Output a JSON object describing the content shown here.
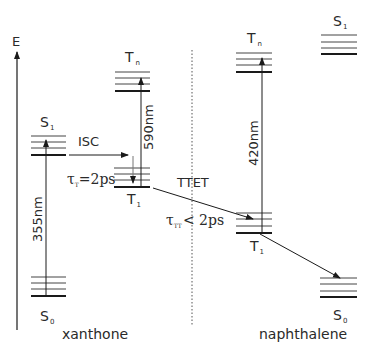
{
  "axis": {
    "label": "E"
  },
  "molecules": {
    "left": {
      "name": "xanthone"
    },
    "right": {
      "name": "naphthalene"
    }
  },
  "states": {
    "xanthone_S0": {
      "main": "S",
      "sub": "0"
    },
    "xanthone_S1": {
      "main": "S",
      "sub": "1"
    },
    "xanthone_T1": {
      "main": "T",
      "sub": "1"
    },
    "xanthone_Tn": {
      "main": "T",
      "sub": "n"
    },
    "naphthalene_S0": {
      "main": "S",
      "sub": "0"
    },
    "naphthalene_S1": {
      "main": "S",
      "sub": "1"
    },
    "naphthalene_T1": {
      "main": "T",
      "sub": "1"
    },
    "naphthalene_Tn": {
      "main": "T",
      "sub": "n"
    }
  },
  "transitions": {
    "excitation": "355nm",
    "isc": "ISC",
    "xanthone_tt": "590nm",
    "ttet": "TTET",
    "naphthalene_tt": "420nm"
  },
  "lifetimes": {
    "tau_t": {
      "symbol": "τ",
      "sub": "T",
      "value": "=2ps"
    },
    "tau_tt": {
      "symbol": "τ",
      "sub": "TT",
      "value": "< 2ps"
    }
  },
  "colors": {
    "line": "#1a1a1a",
    "thin": "#555555",
    "text": "#2a2a2a"
  }
}
